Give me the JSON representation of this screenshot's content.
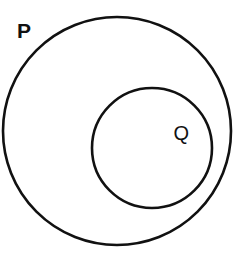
{
  "diagram": {
    "type": "euler-diagram",
    "background_color": "#ffffff",
    "stroke_color": "#111111",
    "stroke_width": 2.6,
    "canvas": {
      "width": 238,
      "height": 262
    },
    "sets": [
      {
        "id": "p",
        "label": "P",
        "role": "outer-set",
        "shape": "circle",
        "center_x": 117,
        "center_y": 131,
        "radius": 114,
        "label_x": 24,
        "label_y": 31,
        "label_weight": "bold",
        "label_placement": "inside-top-left"
      },
      {
        "id": "q",
        "label": "Q",
        "role": "inner-set",
        "shape": "circle",
        "center_x": 152,
        "center_y": 148,
        "radius": 60,
        "label_x": 180,
        "label_y": 133,
        "label_weight": "regular",
        "label_placement": "inside-right"
      }
    ],
    "relation": "Q ⊂ P"
  }
}
